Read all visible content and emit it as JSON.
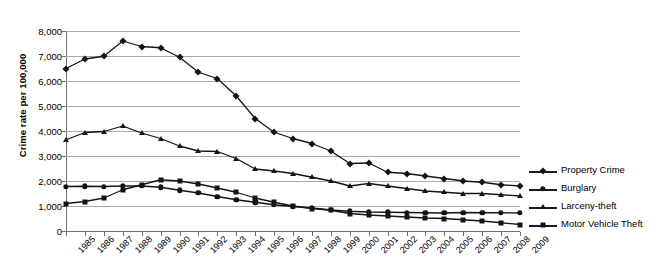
{
  "chart_data": {
    "type": "line",
    "title": "",
    "xlabel": "",
    "ylabel": "Crime rate per 100,000",
    "ylim": [
      0,
      8000
    ],
    "yticks": [
      0,
      1000,
      2000,
      3000,
      4000,
      5000,
      6000,
      7000,
      8000
    ],
    "ytick_labels": [
      "0",
      "1,000",
      "2,000",
      "3,000",
      "4,000",
      "5,000",
      "6,000",
      "7,000",
      "8,000"
    ],
    "grid": true,
    "legend_position": "right",
    "categories": [
      "1985",
      "1986",
      "1987",
      "1988",
      "1989",
      "1990",
      "1991",
      "1992",
      "1993",
      "1994",
      "1995",
      "1996",
      "1997",
      "1998",
      "1999",
      "2000",
      "2001",
      "2002",
      "2003",
      "2004",
      "2005",
      "2006",
      "2007",
      "2008",
      "2009"
    ],
    "series": [
      {
        "name": "Property Crime",
        "marker": "diamond",
        "color": "#141414",
        "values": [
          6500,
          6880,
          6990,
          7600,
          7380,
          7330,
          6950,
          6350,
          6100,
          5400,
          4500,
          3950,
          3700,
          3500,
          3200,
          2700,
          2720,
          2350,
          2300,
          2200,
          2100,
          2000,
          1950,
          1850,
          1800
        ]
      },
      {
        "name": "Burglary",
        "marker": "circle",
        "color": "#141414",
        "values": [
          1780,
          1790,
          1780,
          1800,
          1800,
          1750,
          1630,
          1520,
          1380,
          1250,
          1150,
          1050,
          980,
          920,
          840,
          790,
          760,
          750,
          740,
          730,
          720,
          740,
          730,
          730,
          720
        ]
      },
      {
        "name": "Larceny-theft",
        "marker": "triangle",
        "color": "#141414",
        "values": [
          3650,
          3940,
          3980,
          4200,
          3920,
          3700,
          3400,
          3200,
          3180,
          2900,
          2480,
          2400,
          2300,
          2150,
          2000,
          1800,
          1900,
          1800,
          1700,
          1600,
          1550,
          1500,
          1500,
          1450,
          1400
        ]
      },
      {
        "name": "Motor Vehicle Theft",
        "marker": "square",
        "color": "#141414",
        "values": [
          1100,
          1180,
          1320,
          1650,
          1850,
          2050,
          2000,
          1880,
          1720,
          1550,
          1320,
          1150,
          1000,
          900,
          830,
          700,
          640,
          600,
          560,
          520,
          500,
          450,
          400,
          330,
          260
        ]
      }
    ]
  },
  "legend": {
    "items": [
      {
        "label": "Property Crime",
        "marker": "diamond"
      },
      {
        "label": "Burglary",
        "marker": "circle"
      },
      {
        "label": "Larceny-theft",
        "marker": "triangle"
      },
      {
        "label": "Motor Vehicle Theft",
        "marker": "square"
      }
    ]
  }
}
